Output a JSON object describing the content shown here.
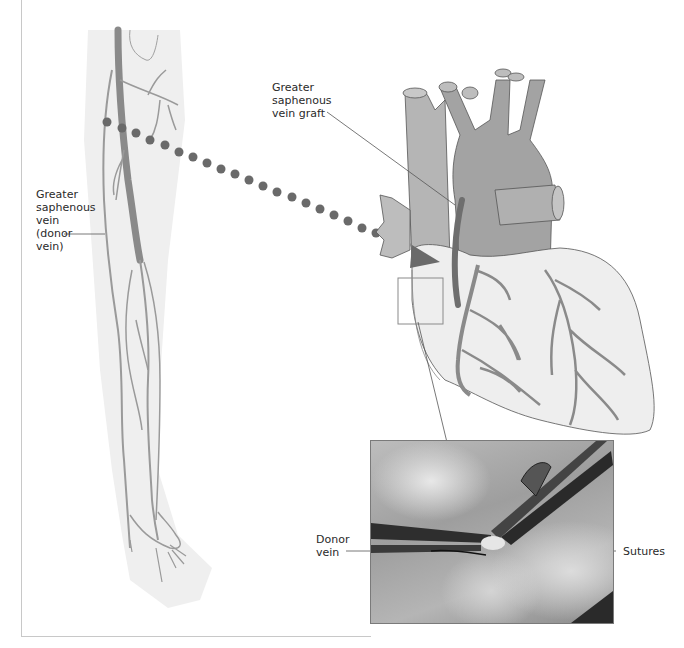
{
  "figure": {
    "labels": {
      "donor_vein_leg": [
        "Greater",
        "saphenous",
        "vein",
        "(donor",
        "vein)"
      ],
      "graft": [
        "Greater",
        "saphenous",
        "vein graft"
      ],
      "donor_vein_photo": [
        "Donor",
        "vein"
      ],
      "sutures": "Sutures"
    },
    "panels": {
      "leg": "leg-illustration",
      "heart": "heart-illustration",
      "photo": "surgical-photo-inset"
    },
    "colors": {
      "vein": "#8a8a8a",
      "graft": "#6e6e6e",
      "heart_fill": "#eeeeee",
      "vessel_fill": "#a9a9a9",
      "dots": "#6a6a6a",
      "leader_line": "#555555"
    }
  }
}
